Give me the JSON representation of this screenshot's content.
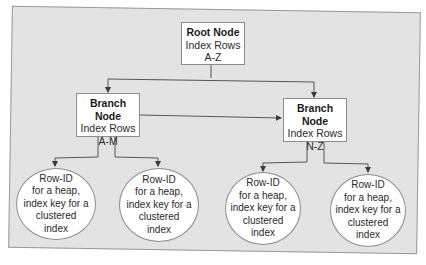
{
  "diagram": {
    "type": "b-tree index structure",
    "root": {
      "title": "Root Node",
      "line1": "Index Rows",
      "line2": "A-Z"
    },
    "branches": [
      {
        "title": "Branch Node",
        "line1": "Index Rows",
        "line2": "A-M"
      },
      {
        "title": "Branch Node",
        "line1": "Index Rows",
        "line2": "N-Z"
      }
    ],
    "leaves": [
      {
        "l1": "Row-ID",
        "l2": "for a heap,",
        "l3": "index key for a",
        "l4": "clustered",
        "l5": "index"
      },
      {
        "l1": "Row-ID",
        "l2": "for a heap,",
        "l3": "index key for a",
        "l4": "clustered",
        "l5": "index"
      },
      {
        "l1": "Row-ID",
        "l2": "for a heap,",
        "l3": "index key for a",
        "l4": "clustered",
        "l5": "index"
      },
      {
        "l1": "Row-ID",
        "l2": "for a heap,",
        "l3": "index key for a",
        "l4": "clustered",
        "l5": "index"
      }
    ],
    "edges": [
      {
        "from": "root",
        "to": "branch-0"
      },
      {
        "from": "root",
        "to": "branch-1"
      },
      {
        "from": "branch-0",
        "to": "branch-1"
      },
      {
        "from": "branch-0",
        "to": "leaf-0"
      },
      {
        "from": "branch-0",
        "to": "leaf-1"
      },
      {
        "from": "branch-1",
        "to": "leaf-2"
      },
      {
        "from": "branch-1",
        "to": "leaf-3"
      }
    ],
    "colors": {
      "panel": "#e3e3e3",
      "node_fill": "#ffffff",
      "border": "#8c8c8c",
      "line": "#4a4a4a"
    }
  }
}
